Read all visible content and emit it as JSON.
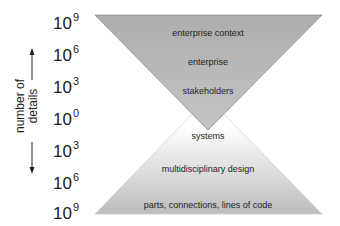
{
  "diagram": {
    "type": "double-funnel / hourglass",
    "colors": {
      "top_triangle_fill": "#b0b0b0",
      "top_triangle_edge": "#8a8a8a",
      "bottom_triangle_top": "#ffffff",
      "bottom_triangle_base": "#bcbcbc",
      "text": "#222222"
    },
    "axis": {
      "label_line1": "number of",
      "label_line2": "details",
      "ticks": [
        {
          "base": "10",
          "exp": "9"
        },
        {
          "base": "10",
          "exp": "6"
        },
        {
          "base": "10",
          "exp": "3"
        },
        {
          "base": "10",
          "exp": "0"
        },
        {
          "base": "10",
          "exp": "3"
        },
        {
          "base": "10",
          "exp": "6"
        },
        {
          "base": "10",
          "exp": "9"
        }
      ]
    },
    "top_triangle": {
      "levels": [
        "enterprise context",
        "enterprise",
        "stakeholders"
      ]
    },
    "bottom_triangle": {
      "levels": [
        "systems",
        "multidisciplinary design",
        "parts, connections, lines of code"
      ]
    }
  }
}
